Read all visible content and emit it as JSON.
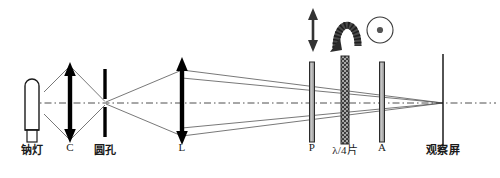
{
  "figure": {
    "type": "optical-ray-diagram",
    "width": 500,
    "height": 178,
    "background_color": "#ffffff",
    "line_color": "#1a1a1a",
    "axis_color": "#3a3a3a",
    "ray_color": "#555555",
    "plate_fill": "#b9b9b9",
    "plate_stroke": "#2a2a2a",
    "waveplate_fill": "#8f8f8f"
  },
  "optical_axis": {
    "label": "optical axis",
    "style": "dash-dot",
    "y": 103,
    "x_start": 30,
    "x_end": 496
  },
  "components": [
    {
      "id": "sodium-lamp",
      "label": "钠灯",
      "kind": "lamp",
      "x": 32,
      "label_x": 32,
      "label_y": 148
    },
    {
      "id": "condenser-lens",
      "label": "C",
      "kind": "lens",
      "x": 70,
      "label_x": 70,
      "label_y": 148
    },
    {
      "id": "pinhole",
      "label": "圆孔",
      "kind": "aperture",
      "x": 105,
      "label_x": 105,
      "label_y": 148
    },
    {
      "id": "objective-lens",
      "label": "L",
      "kind": "lens",
      "x": 182,
      "label_x": 182,
      "label_y": 148
    },
    {
      "id": "polarizer",
      "label": "P",
      "kind": "plate",
      "x": 312,
      "label_x": 312,
      "label_y": 148
    },
    {
      "id": "quarter-wave-plate",
      "label": "λ/4片",
      "kind": "waveplate",
      "x": 345,
      "label_x": 345,
      "label_y": 148
    },
    {
      "id": "analyzer",
      "label": "A",
      "kind": "plate",
      "x": 382,
      "label_x": 382,
      "label_y": 148
    },
    {
      "id": "observation-screen",
      "label": "观察屏",
      "kind": "screen",
      "x": 443,
      "label_x": 443,
      "label_y": 148
    }
  ],
  "polarization_icons": [
    {
      "id": "linear-polarization",
      "glyph": "vertical-double-arrow",
      "x": 313,
      "y": 30
    },
    {
      "id": "circular-polarization",
      "glyph": "curved-arch-arrow",
      "x": 346,
      "y": 30
    },
    {
      "id": "axial-polarization",
      "glyph": "circle-with-dot",
      "x": 380,
      "y": 30
    }
  ]
}
